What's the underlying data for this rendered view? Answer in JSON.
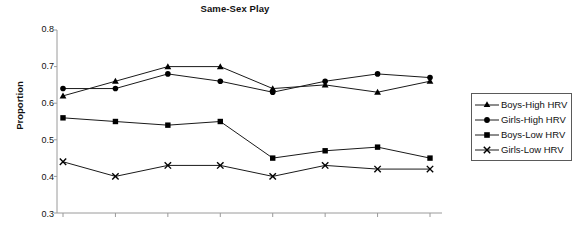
{
  "chart_data": {
    "type": "line",
    "title": "Same-Sex Play",
    "xlabel": "",
    "ylabel": "Proportion",
    "ylim": [
      0.3,
      0.8
    ],
    "yticks": [
      "0.8",
      "0.7",
      "0.6",
      "0.5",
      "0.4",
      "0.3"
    ],
    "ytick_values": [
      0.8,
      0.7,
      0.6,
      0.5,
      0.4,
      0.3
    ],
    "x": [
      1,
      2,
      3,
      4,
      5,
      6,
      7,
      8
    ],
    "xtick_labels": [
      "",
      "",
      "",
      "",
      "",
      "",
      "",
      ""
    ],
    "grid": false,
    "legend_position": "right",
    "series": [
      {
        "name": "Boys-High HRV",
        "marker": "triangle",
        "color": "#000000",
        "values": [
          0.62,
          0.66,
          0.7,
          0.7,
          0.64,
          0.65,
          0.63,
          0.66
        ]
      },
      {
        "name": "Girls-High HRV",
        "marker": "circle",
        "color": "#000000",
        "values": [
          0.64,
          0.64,
          0.68,
          0.66,
          0.63,
          0.66,
          0.68,
          0.67
        ]
      },
      {
        "name": "Boys-Low HRV",
        "marker": "square",
        "color": "#000000",
        "values": [
          0.56,
          0.55,
          0.54,
          0.55,
          0.45,
          0.47,
          0.48,
          0.45
        ]
      },
      {
        "name": "Girls-Low HRV",
        "marker": "cross-x",
        "color": "#000000",
        "values": [
          0.44,
          0.4,
          0.43,
          0.43,
          0.4,
          0.43,
          0.42,
          0.42
        ]
      }
    ]
  },
  "legend": {
    "entries": [
      {
        "label": "Boys-High HRV",
        "marker": "triangle"
      },
      {
        "label": "Girls-High HRV",
        "marker": "circle"
      },
      {
        "label": "Boys-Low HRV",
        "marker": "square"
      },
      {
        "label": "Girls-Low HRV",
        "marker": "cross-x"
      }
    ]
  },
  "axis_colors": {
    "axis_line": "#9a9a9a",
    "series_line": "#1a1a1a",
    "legend_border": "#5a5a5a"
  }
}
